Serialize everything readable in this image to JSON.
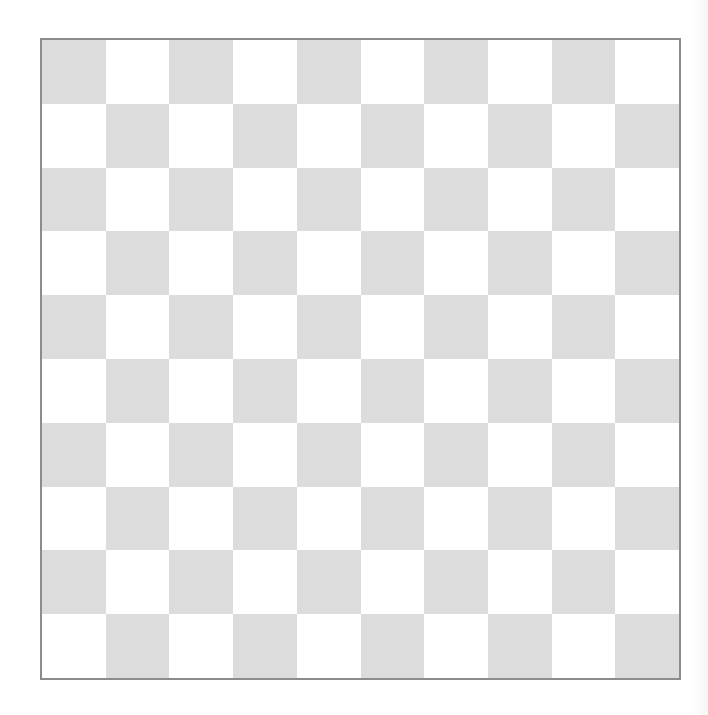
{
  "board": {
    "type": "draughts-board",
    "rows": 10,
    "cols": 10,
    "top_left_color": "dark",
    "colors": {
      "dark": "#dcdcdc",
      "light": "#ffffff",
      "border": "#8c8c8c",
      "background": "#ffffff"
    },
    "pieces": []
  }
}
